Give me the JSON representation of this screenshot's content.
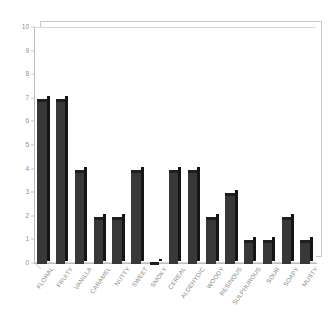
{
  "chart_data": {
    "type": "bar",
    "title": "",
    "subtitle": "",
    "xlabel": "",
    "ylabel": "",
    "ylim": [
      0,
      10
    ],
    "yticks": [
      0,
      1,
      2,
      3,
      4,
      5,
      6,
      7,
      8,
      9,
      10
    ],
    "grid": false,
    "legend": null,
    "bar_color": "#383838",
    "frame_color": "#c9c9c9",
    "tick_label_color": "#8f8f8f",
    "categories": [
      "FLORAL",
      "FRUITY",
      "VANILLA",
      "CARAMEL",
      "NUTTY",
      "SWEET",
      "SMOKY",
      "CEREAL",
      "ALDEHYDIC",
      "WOODY",
      "RESINOUS",
      "SULPHUROUS",
      "SOUR",
      "SOAPY",
      "MUSTY"
    ],
    "values": [
      7,
      7,
      4,
      2,
      2,
      4,
      0,
      4,
      4,
      2,
      3,
      1,
      1,
      2,
      1
    ]
  }
}
